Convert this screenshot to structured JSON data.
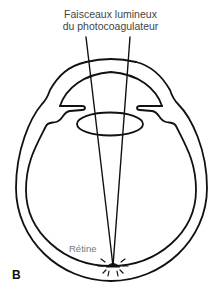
{
  "diagram": {
    "title_line1": "Faisceaux lumineux",
    "title_line2": "du photocoagulateur",
    "retina_label": "Rétine",
    "panel_letter": "B",
    "stroke_color": "#111111",
    "parts": [
      "sclera-outer-wall",
      "retina-inner-wall",
      "cornea",
      "iris",
      "lens",
      "light-beams",
      "laser-impact-point"
    ]
  }
}
